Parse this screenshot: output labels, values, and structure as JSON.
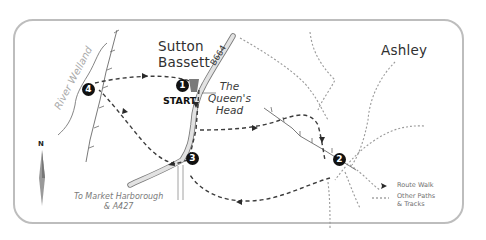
{
  "places": {
    "sutton_line1": "Sutton",
    "sutton_line2": "Bassett",
    "ashley": "Ashley"
  },
  "start_label": "START",
  "pub": {
    "line1": "The",
    "line2": "Queen's",
    "line3": "Head"
  },
  "road_label": "B664",
  "river_label": "River Welland",
  "destination": {
    "line1": "To Market Harborough",
    "line2": "& A427"
  },
  "north_label": "N",
  "waypoints": [
    {
      "id": "1",
      "label": "1"
    },
    {
      "id": "2",
      "label": "2"
    },
    {
      "id": "3",
      "label": "3"
    },
    {
      "id": "4",
      "label": "4"
    }
  ],
  "legend": {
    "route_walk": "Route Walk",
    "other_paths_line1": "Other Paths",
    "other_paths_line2": "& Tracks"
  },
  "colors": {
    "frame": "#bdbdbd",
    "route": "#3c3c3c",
    "paths": "#9a9a9a",
    "road": "#cfcfcf",
    "waypoint": "#111111",
    "pub_icon": "#7a7a7a"
  }
}
